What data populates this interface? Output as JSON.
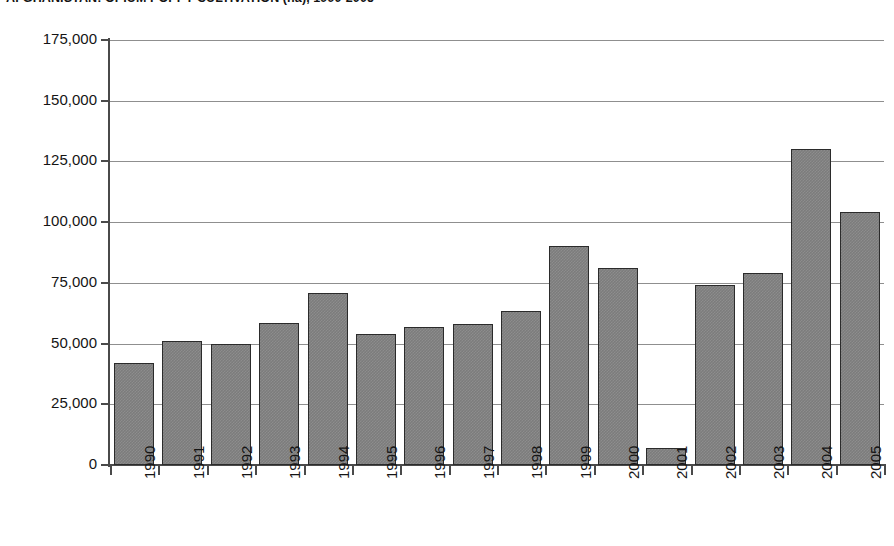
{
  "chart_data": {
    "type": "bar",
    "title": "AFGHANISTAN: OPIUM POPPY CULTIVATION (ha), 1990-2005",
    "xlabel": "",
    "ylabel": "",
    "categories": [
      "1990",
      "1991",
      "1992",
      "1993",
      "1994",
      "1995",
      "1996",
      "1997",
      "1998",
      "1999",
      "2000",
      "2001",
      "2002",
      "2003",
      "2004",
      "2005"
    ],
    "values": [
      42000,
      51000,
      50000,
      58500,
      71000,
      54000,
      57000,
      58000,
      63500,
      90000,
      81000,
      7000,
      74000,
      79000,
      130000,
      104000
    ],
    "ylim": [
      0,
      175000
    ],
    "ytick_values": [
      0,
      25000,
      50000,
      75000,
      100000,
      125000,
      150000,
      175000
    ],
    "ytick_labels": [
      "0",
      "25,000",
      "50,000",
      "75,000",
      "100,000",
      "125,000",
      "150,000",
      "175,000"
    ],
    "grid": true,
    "grid_axis": "y",
    "legend": false,
    "legend_position": "none",
    "series_name": "Opium poppy cultivation (ha)",
    "bar_color": "#7c7c7c",
    "bar_border_color": "#2b2b2b",
    "grid_color": "#8f8f8f",
    "axis_color": "#4a4a4a",
    "background_color": "#ffffff",
    "xtick_label_rotation": 90
  }
}
